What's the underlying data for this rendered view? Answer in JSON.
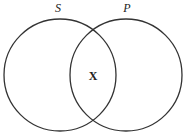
{
  "diagram": {
    "type": "venn",
    "sets": [
      {
        "label": "S",
        "cx": 60,
        "cy": 75,
        "r": 56
      },
      {
        "label": "P",
        "cx": 126,
        "cy": 75,
        "r": 56
      }
    ],
    "intersection_mark": "X",
    "colors": {
      "stroke": "#333333",
      "background": "#ffffff"
    }
  }
}
